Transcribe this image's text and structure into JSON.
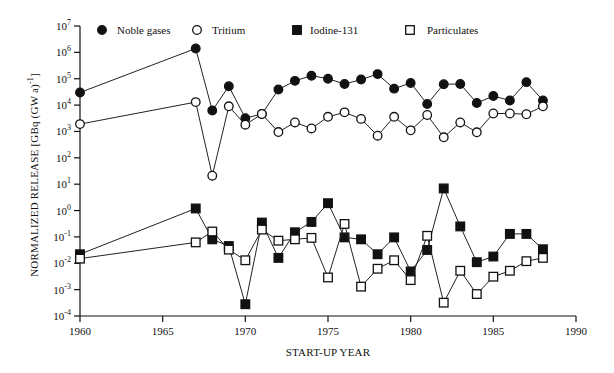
{
  "chart_data": {
    "type": "line",
    "title": "",
    "xlabel": "START-UP YEAR",
    "ylabel": "NORMALIZED RELEASE [GBq (GW a)^-1]",
    "yscale": "log",
    "xlim": [
      1960,
      1990
    ],
    "ylim": [
      0.0001,
      10000000
    ],
    "grid": false,
    "legend_position": "top",
    "x_ticks": [
      1960,
      1965,
      1970,
      1975,
      1980,
      1985,
      1990
    ],
    "x_tick_labels": [
      "1960",
      "1965",
      "1970",
      "1975",
      "1980",
      "1985",
      "1990"
    ],
    "y_ticks_exp": [
      7,
      6,
      5,
      4,
      3,
      2,
      1,
      0,
      -1,
      -2,
      -3,
      -4
    ],
    "x": [
      1960,
      1967,
      1968,
      1969,
      1970,
      1971,
      1972,
      1973,
      1974,
      1975,
      1976,
      1977,
      1978,
      1979,
      1980,
      1981,
      1982,
      1983,
      1984,
      1985,
      1986,
      1987,
      1988
    ],
    "series": [
      {
        "name": "Noble gases",
        "marker": "filled-circle",
        "values": [
          30000,
          1400000,
          6200,
          52000,
          3200,
          4600,
          39000,
          83000,
          130000,
          100000,
          63000,
          93000,
          150000,
          42000,
          69000,
          11000,
          62000,
          63000,
          12000,
          22000,
          15000,
          74000,
          15000
        ]
      },
      {
        "name": "Tritium",
        "marker": "open-circle",
        "values": [
          1900,
          13000,
          21,
          9000,
          1800,
          4600,
          950,
          2200,
          1300,
          3600,
          5300,
          3000,
          690,
          3600,
          1100,
          4200,
          600,
          2200,
          930,
          4800,
          4800,
          4500,
          9000
        ]
      },
      {
        "name": "Iodine-131",
        "marker": "filled-square",
        "values": [
          0.022,
          1.2,
          0.081,
          0.045,
          0.00028,
          0.35,
          0.016,
          0.15,
          0.37,
          1.9,
          0.096,
          0.081,
          0.022,
          0.096,
          0.0049,
          0.032,
          6.9,
          0.25,
          0.011,
          0.018,
          0.13,
          0.13,
          0.034
        ]
      },
      {
        "name": "Particulates",
        "marker": "open-square",
        "values": [
          0.015,
          0.062,
          0.16,
          0.033,
          0.013,
          0.19,
          0.072,
          0.081,
          0.092,
          0.0029,
          0.31,
          0.0013,
          0.0062,
          0.013,
          0.0023,
          0.11,
          0.00032,
          0.0052,
          0.00068,
          0.0031,
          0.0052,
          0.012,
          0.016
        ]
      }
    ]
  },
  "legend": {
    "items": [
      {
        "label": "Noble gases",
        "marker": "filled-circle"
      },
      {
        "label": "Tritium",
        "marker": "open-circle"
      },
      {
        "label": "Iodine-131",
        "marker": "filled-square"
      },
      {
        "label": "Particulates",
        "marker": "open-square"
      }
    ]
  },
  "axes": {
    "x_title": "START-UP YEAR",
    "y_title": "NORMALIZED RELEASE [GBq (GW a)",
    "y_title_sup": "-1",
    "y_title_end": "]"
  }
}
